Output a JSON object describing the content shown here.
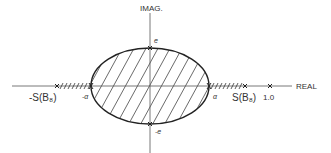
{
  "diagram": {
    "axes": {
      "vertical_label": "IMAG.",
      "horizontal_label": "REAL"
    },
    "points": {
      "top": "e",
      "bottom": "-e",
      "left_alpha": "-α",
      "right_alpha": "α",
      "neg_s": "-S(B₈)",
      "pos_s": "S(B₈)",
      "one": "1.0"
    },
    "colors": {
      "line": "#333333",
      "background": "#ffffff"
    }
  }
}
